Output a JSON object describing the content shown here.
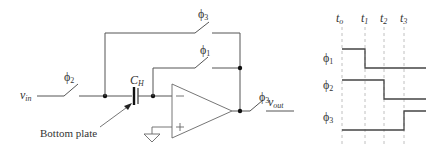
{
  "circuit": {
    "input_label": "v",
    "input_sub": "in",
    "output_label": "v",
    "output_sub": "out",
    "capacitor_label": "C",
    "capacitor_sub": "H",
    "annotation": "Bottom plate",
    "switches": {
      "input": {
        "phase": "ϕ",
        "sub": "2"
      },
      "feedback_top": {
        "phase": "ϕ",
        "sub": "3"
      },
      "feedback_reset": {
        "phase": "ϕ",
        "sub": "1"
      },
      "output": {
        "phase": "ϕ",
        "sub": "3"
      }
    },
    "opamp": {
      "minus": "−",
      "plus": "+"
    }
  },
  "timing": {
    "times": [
      {
        "label": "t",
        "sub": "o"
      },
      {
        "label": "t",
        "sub": "1"
      },
      {
        "label": "t",
        "sub": "2"
      },
      {
        "label": "t",
        "sub": "3"
      }
    ],
    "phases": [
      {
        "label": "ϕ",
        "sub": "1",
        "waveform": "high t_o–t_1, low after t_1"
      },
      {
        "label": "ϕ",
        "sub": "2",
        "waveform": "high t_o–t_2, low after t_2"
      },
      {
        "label": "ϕ",
        "sub": "3",
        "waveform": "low t_o–t_3, high after t_3"
      }
    ]
  }
}
